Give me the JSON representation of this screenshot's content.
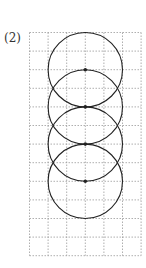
{
  "problem_label": "(2)",
  "diagram": {
    "grid": {
      "columns": 6,
      "rows": 12,
      "line_style": "dotted",
      "line_color": "#9a9a9a"
    },
    "circles": [
      {
        "center_col": 3,
        "center_row": 2,
        "radius_cells": 2,
        "center_dot": true
      },
      {
        "center_col": 3,
        "center_row": 4,
        "radius_cells": 2,
        "center_dot": true
      },
      {
        "center_col": 3,
        "center_row": 6,
        "radius_cells": 2,
        "center_dot": true
      },
      {
        "center_col": 3,
        "center_row": 8,
        "radius_cells": 2,
        "center_dot": true
      }
    ],
    "stroke_color": "#222222"
  }
}
